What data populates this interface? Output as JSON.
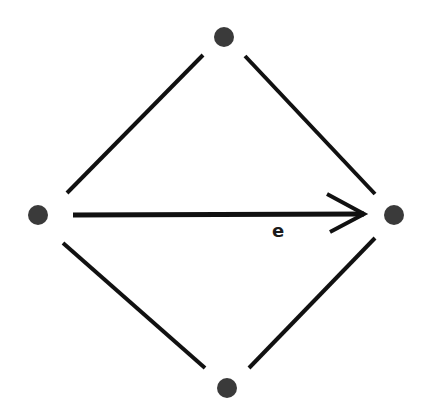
{
  "diagram": {
    "type": "graph",
    "node_color": "#3a3a3a",
    "edge_color": "#111111",
    "nodes": [
      {
        "id": "top",
        "x": 224,
        "y": 37
      },
      {
        "id": "left",
        "x": 38,
        "y": 215
      },
      {
        "id": "right",
        "x": 394,
        "y": 215
      },
      {
        "id": "bottom",
        "x": 227,
        "y": 388
      }
    ],
    "edges": [
      {
        "from": "left",
        "to": "top",
        "directed": false
      },
      {
        "from": "top",
        "to": "right",
        "directed": false
      },
      {
        "from": "left",
        "to": "bottom",
        "directed": false
      },
      {
        "from": "bottom",
        "to": "right",
        "directed": false
      },
      {
        "from": "left",
        "to": "right",
        "directed": true,
        "label": "e"
      }
    ],
    "edge_label": "e"
  }
}
